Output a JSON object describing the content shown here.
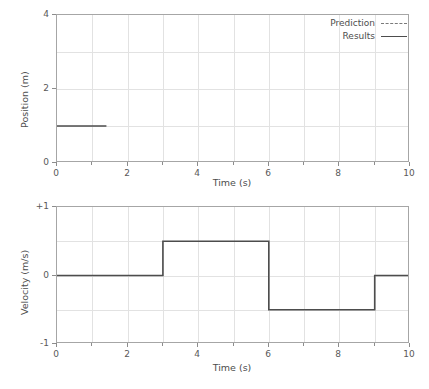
{
  "chart_data": [
    {
      "type": "line",
      "id": "position-vs-time",
      "title": "",
      "xlabel": "Time (s)",
      "ylabel": "Position (m)",
      "xlim": [
        0,
        10
      ],
      "ylim": [
        0,
        4
      ],
      "xticks": [
        0,
        2,
        4,
        6,
        8,
        10
      ],
      "xtick_labels": [
        "0",
        "2",
        "4",
        "6",
        "8",
        "10"
      ],
      "xticks_minor": [
        1,
        3,
        5,
        7,
        9
      ],
      "yticks": [
        0,
        2,
        4
      ],
      "ytick_labels": [
        "0",
        "2",
        "4"
      ],
      "grid": true,
      "grid_x": [
        1,
        2,
        3,
        4,
        5,
        6,
        7,
        8,
        9
      ],
      "grid_y": [
        1,
        2,
        3
      ],
      "legend": {
        "position": "upper right",
        "entries": [
          {
            "label": "Prediction",
            "style": "dashed"
          },
          {
            "label": "Results",
            "style": "solid"
          }
        ]
      },
      "series": [
        {
          "name": "Results",
          "style": "solid",
          "color": "#4d4d4d",
          "x": [
            0,
            1.4
          ],
          "y": [
            1,
            1
          ]
        }
      ]
    },
    {
      "type": "line",
      "id": "velocity-vs-time",
      "title": "",
      "xlabel": "Time (s)",
      "ylabel": "Velocity (m/s)",
      "xlim": [
        0,
        10
      ],
      "ylim": [
        -1,
        1
      ],
      "xticks": [
        0,
        2,
        4,
        6,
        8,
        10
      ],
      "xtick_labels": [
        "0",
        "2",
        "4",
        "6",
        "8",
        "10"
      ],
      "xticks_minor": [
        1,
        3,
        5,
        7,
        9
      ],
      "yticks": [
        -1,
        0,
        1
      ],
      "ytick_labels": [
        "-1",
        "0",
        "+1"
      ],
      "grid": true,
      "grid_x": [
        1,
        2,
        3,
        4,
        5,
        6,
        7,
        8,
        9
      ],
      "grid_y": [
        -0.5,
        0,
        0.5
      ],
      "legend": null,
      "series": [
        {
          "name": "Results",
          "style": "solid",
          "color": "#4d4d4d",
          "x": [
            0,
            3,
            3,
            6,
            6,
            9,
            9,
            10
          ],
          "y": [
            0,
            0,
            0.5,
            0.5,
            -0.5,
            -0.5,
            0,
            0
          ]
        }
      ]
    }
  ],
  "colors": {
    "line": "#4d4d4d",
    "grid": "#e2e2e2",
    "axis": "#a6a6a6",
    "text": "#4d4d4d",
    "background": "#ffffff"
  }
}
